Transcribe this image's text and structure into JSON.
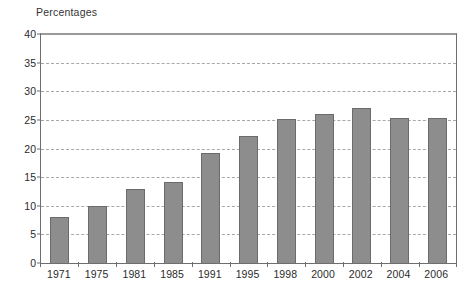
{
  "chart_data": {
    "type": "bar",
    "title": "Percentages",
    "xlabel": "",
    "ylabel": "Percentages",
    "categories": [
      "1971",
      "1975",
      "1981",
      "1985",
      "1991",
      "1995",
      "1998",
      "2000",
      "2002",
      "2004",
      "2006"
    ],
    "values": [
      8.0,
      10.0,
      13.0,
      14.1,
      19.2,
      22.1,
      25.2,
      26.1,
      27.1,
      25.3,
      25.3
    ],
    "ylim": [
      0,
      40
    ],
    "ytick_interval": 5,
    "ytick_labels": [
      "40",
      "35",
      "30",
      "25",
      "20",
      "15",
      "10",
      "5",
      "0"
    ],
    "ytick_values": [
      40,
      35,
      30,
      25,
      20,
      15,
      10,
      5,
      0
    ],
    "grid": true,
    "grid_style": "dashed-horizontal",
    "legend": null,
    "legend_position": "none",
    "colors": {
      "bar_fill": "#8d8d8d",
      "bar_border": "#6b6b6b",
      "gridline": "#a8a8a8",
      "axis": "#6e6e6e",
      "text": "#2b2b2b",
      "background": "#ffffff"
    }
  }
}
